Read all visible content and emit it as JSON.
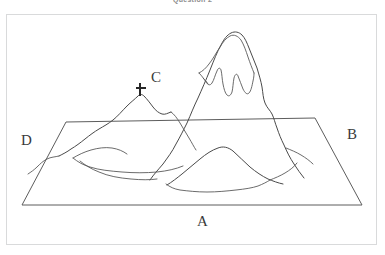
{
  "header": {
    "caption": "Question 2"
  },
  "figure": {
    "title": "",
    "labels": [
      {
        "id": "A",
        "text": "A",
        "role": "front-edge-of-base-plane"
      },
      {
        "id": "B",
        "text": "B",
        "role": "right-edge-of-base-plane"
      },
      {
        "id": "C",
        "text": "C",
        "role": "marked-summit-with-cross"
      },
      {
        "id": "D",
        "text": "D",
        "role": "left-edge-of-base-plane"
      }
    ],
    "markers": [
      {
        "id": "summit-cross",
        "symbol": "cross",
        "color": "#262626",
        "label": "C"
      }
    ],
    "colors": {
      "ink": "#4a4a4a",
      "plane": "#5d5d5d",
      "panel_border": "#d9dadb",
      "background": "#ffffff",
      "label_text": "#3a3a3a"
    }
  }
}
